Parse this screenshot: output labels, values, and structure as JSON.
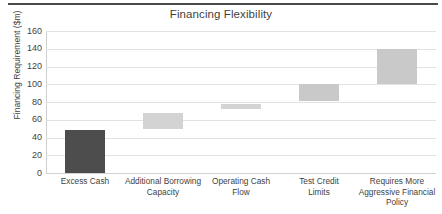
{
  "chart_data": {
    "type": "bar",
    "title": "Financing Flexibility",
    "xlabel": "",
    "ylabel": "Financing Requirement ($m)",
    "ylim": [
      0,
      160
    ],
    "yticks": [
      0,
      20,
      40,
      60,
      80,
      100,
      120,
      140,
      160
    ],
    "ytick_labels": [
      "0",
      "20",
      "40",
      "60",
      "80",
      "100",
      "120",
      "140",
      "160"
    ],
    "grid": true,
    "legend": "none",
    "categories": [
      "Excess Cash",
      "Additional Borrowing Capacity",
      "Operating Cash Flow",
      "Test Credit Limits",
      "Requires More Aggressive Financial Policy"
    ],
    "series": [
      {
        "name": "Financing Requirement range",
        "bars": [
          {
            "category": "Excess Cash",
            "base": 0,
            "top": 48,
            "value": 48,
            "color": "#4d4d4d",
            "shape": "rect"
          },
          {
            "category": "Additional Borrowing Capacity",
            "base": 50,
            "top": 68,
            "value": 18,
            "color": "#d3d3d3",
            "shape": "rect"
          },
          {
            "category": "Operating Cash Flow",
            "base": 72,
            "top": 78,
            "value": 6,
            "color": "#d3d3d3",
            "shape": "rect"
          },
          {
            "category": "Test Credit Limits",
            "base": 81,
            "top": 100,
            "value": 19,
            "color": "#c9c9c9",
            "shape": "rect"
          },
          {
            "category": "Requires More Aggressive Financial Policy",
            "base": 100,
            "top": 140,
            "arrow_tip": 157,
            "value": 40,
            "color": "#c9c9c9",
            "shape": "arrow-up"
          }
        ]
      }
    ],
    "colors": {
      "dark_bar": "#4d4d4d",
      "light_bar": "#d0d0d0",
      "gridline": "#e2e2e2",
      "text": "#3f3f3f",
      "rule": "#4a4a4a",
      "background": "#ffffff"
    }
  },
  "category_labels": [
    {
      "lines": [
        "Excess Cash"
      ]
    },
    {
      "lines": [
        "Additional Borrowing",
        "Capacity"
      ]
    },
    {
      "lines": [
        "Operating Cash",
        "Flow"
      ]
    },
    {
      "lines": [
        "Test Credit",
        "Limits"
      ]
    },
    {
      "lines": [
        "Requires More",
        "Aggressive Financial",
        "Policy"
      ]
    }
  ]
}
